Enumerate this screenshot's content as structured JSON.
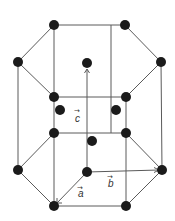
{
  "diagram": {
    "colors": {
      "atom": "#1b1b1b",
      "edge": "#5a5a5a",
      "background": "#ffffff"
    },
    "labels": {
      "a": "a",
      "b": "b",
      "c": "c",
      "vector_arrow": "→"
    },
    "atoms": {
      "corner": [
        {
          "x": 54,
          "y": 25
        },
        {
          "x": 125,
          "y": 25
        },
        {
          "x": 18,
          "y": 62
        },
        {
          "x": 161,
          "y": 62
        },
        {
          "x": 54,
          "y": 97
        },
        {
          "x": 126,
          "y": 97
        },
        {
          "x": 87,
          "y": 63
        },
        {
          "x": 54,
          "y": 133
        },
        {
          "x": 126,
          "y": 133
        },
        {
          "x": 18,
          "y": 170
        },
        {
          "x": 162,
          "y": 170
        },
        {
          "x": 87,
          "y": 172
        },
        {
          "x": 54,
          "y": 206
        },
        {
          "x": 126,
          "y": 206
        }
      ],
      "interior": [
        {
          "x": 60,
          "y": 110
        },
        {
          "x": 116,
          "y": 110
        },
        {
          "x": 92,
          "y": 141
        }
      ]
    }
  }
}
